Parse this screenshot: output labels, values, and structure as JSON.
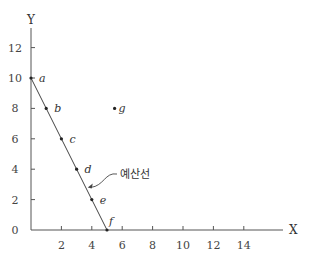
{
  "chart_data": {
    "type": "line",
    "title": "",
    "xlabel": "X",
    "ylabel": "Y",
    "xlim": [
      0,
      16
    ],
    "ylim": [
      0,
      13
    ],
    "x_ticks": [
      2,
      4,
      6,
      8,
      10,
      12,
      14
    ],
    "y_ticks": [
      0,
      2,
      4,
      6,
      8,
      10,
      12
    ],
    "grid": false,
    "series": [
      {
        "name": "예산선",
        "points": [
          {
            "label": "a",
            "x": 0,
            "y": 10
          },
          {
            "label": "b",
            "x": 1,
            "y": 8
          },
          {
            "label": "c",
            "x": 2,
            "y": 6
          },
          {
            "label": "d",
            "x": 3,
            "y": 4
          },
          {
            "label": "e",
            "x": 4,
            "y": 2
          },
          {
            "label": "f",
            "x": 5,
            "y": 0
          }
        ]
      }
    ],
    "extra_points": [
      {
        "label": "g",
        "x": 5.5,
        "y": 8
      }
    ],
    "annotations": [
      {
        "text": "예산선",
        "points_to": {
          "x": 3.6,
          "y": 2.8
        }
      }
    ]
  },
  "labels": {
    "x_axis": "X",
    "y_axis": "Y",
    "origin": "0",
    "annotation": "예산선"
  }
}
